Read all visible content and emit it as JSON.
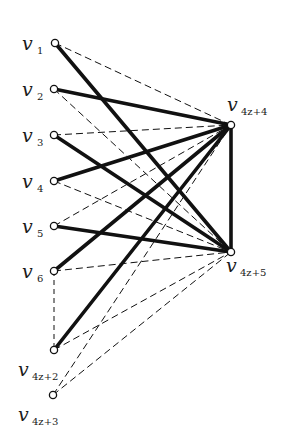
{
  "diagram": {
    "type": "bipartite-graph",
    "colors": {
      "ink": "#111111",
      "background": "#ffffff"
    },
    "nodes": [
      {
        "id": "v1",
        "base": "v",
        "sub": "1",
        "x": 55,
        "y": 43,
        "label_x": 22,
        "label_y": 50,
        "sub_x": 37,
        "sub_y": 54
      },
      {
        "id": "v2",
        "base": "v",
        "sub": "2",
        "x": 54,
        "y": 89,
        "label_x": 22,
        "label_y": 96,
        "sub_x": 37,
        "sub_y": 100
      },
      {
        "id": "v3",
        "base": "v",
        "sub": "3",
        "x": 54,
        "y": 135,
        "label_x": 22,
        "label_y": 142,
        "sub_x": 37,
        "sub_y": 146
      },
      {
        "id": "v4",
        "base": "v",
        "sub": "4",
        "x": 54,
        "y": 181,
        "label_x": 22,
        "label_y": 188,
        "sub_x": 37,
        "sub_y": 192
      },
      {
        "id": "v5",
        "base": "v",
        "sub": "5",
        "x": 54,
        "y": 226,
        "label_x": 22,
        "label_y": 233,
        "sub_x": 37,
        "sub_y": 237
      },
      {
        "id": "v6",
        "base": "v",
        "sub": "6",
        "x": 54,
        "y": 271,
        "label_x": 22,
        "label_y": 278,
        "sub_x": 37,
        "sub_y": 282
      },
      {
        "id": "v4z2",
        "base": "v",
        "sub": "4z+2",
        "x": 54,
        "y": 350,
        "label_x": 18,
        "label_y": 376,
        "sub_x": 32,
        "sub_y": 380
      },
      {
        "id": "v4z3",
        "base": "v",
        "sub": "4z+3",
        "x": 53,
        "y": 395,
        "label_x": 18,
        "label_y": 421,
        "sub_x": 32,
        "sub_y": 425
      },
      {
        "id": "v4z4",
        "base": "v",
        "sub": "4z+4",
        "x": 231,
        "y": 125,
        "label_x": 227,
        "label_y": 111,
        "sub_x": 241,
        "sub_y": 115
      },
      {
        "id": "v4z5",
        "base": "v",
        "sub": "4z+5",
        "x": 231,
        "y": 252,
        "label_x": 226,
        "label_y": 272,
        "sub_x": 240,
        "sub_y": 276
      }
    ],
    "edges": [
      {
        "from": "v1",
        "to": "v4z4",
        "style": "dashed"
      },
      {
        "from": "v1",
        "to": "v4z5",
        "style": "solid"
      },
      {
        "from": "v2",
        "to": "v4z4",
        "style": "solid"
      },
      {
        "from": "v2",
        "to": "v4z5",
        "style": "dashed"
      },
      {
        "from": "v3",
        "to": "v4z4",
        "style": "dashed"
      },
      {
        "from": "v3",
        "to": "v4z5",
        "style": "solid"
      },
      {
        "from": "v4",
        "to": "v4z4",
        "style": "solid"
      },
      {
        "from": "v4",
        "to": "v4z5",
        "style": "dashed"
      },
      {
        "from": "v5",
        "to": "v4z4",
        "style": "dashed"
      },
      {
        "from": "v5",
        "to": "v4z5",
        "style": "solid"
      },
      {
        "from": "v6",
        "to": "v4z4",
        "style": "solid"
      },
      {
        "from": "v6",
        "to": "v4z5",
        "style": "dashed"
      },
      {
        "from": "v4z2",
        "to": "v4z4",
        "style": "solid"
      },
      {
        "from": "v4z2",
        "to": "v4z5",
        "style": "dashed"
      },
      {
        "from": "v4z3",
        "to": "v4z4",
        "style": "dashed"
      },
      {
        "from": "v4z3",
        "to": "v4z5",
        "style": "dashed"
      },
      {
        "from": "v4z4",
        "to": "v4z5",
        "style": "solid"
      },
      {
        "from": "v6",
        "to": "v4z2",
        "style": "dotted-ellipsis"
      }
    ]
  }
}
